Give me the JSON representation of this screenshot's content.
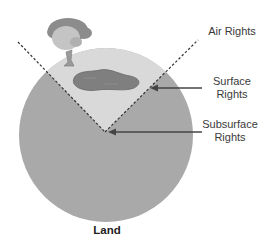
{
  "diagram": {
    "title": "Land",
    "labels": {
      "air": "Air Rights",
      "surface_line1": "Surface",
      "surface_line2": "Rights",
      "subsurface_line1": "Subsurface",
      "subsurface_line2": "Rights"
    },
    "icons": [
      "tree-icon",
      "pond-icon"
    ],
    "colors": {
      "earth": "#a9a9a9",
      "surface_wedge": "#d9d9d9",
      "pond": "#7f7f7f",
      "tree_canopy_dark": "#8c8c8c",
      "tree_canopy_light": "#c4c4c4",
      "arrow": "#444444"
    }
  }
}
